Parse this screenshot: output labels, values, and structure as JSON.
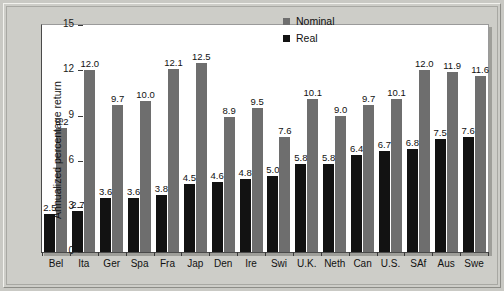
{
  "chart_data": {
    "type": "bar",
    "title": "",
    "subtitle": "",
    "xlabel": "",
    "ylabel": "Annualized percentage return",
    "ylim": [
      0,
      15
    ],
    "yticks": [
      0,
      3,
      6,
      9,
      12,
      15
    ],
    "grid": false,
    "legend_position": "top-right",
    "categories": [
      "Bel",
      "Ita",
      "Ger",
      "Spa",
      "Fra",
      "Jap",
      "Den",
      "Ire",
      "Swi",
      "U.K.",
      "Neth",
      "Can",
      "U.S.",
      "SAf",
      "Aus",
      "Swe"
    ],
    "series": [
      {
        "name": "Real",
        "color": "#121212",
        "values": [
          2.5,
          2.7,
          3.6,
          3.6,
          3.8,
          4.5,
          4.6,
          4.8,
          5.0,
          5.8,
          5.8,
          6.4,
          6.7,
          6.8,
          7.5,
          7.6
        ],
        "labels": [
          "2.5",
          "2.7",
          "3.6",
          "3.6",
          "3.8",
          "4.5",
          "4.6",
          "4.8",
          "5.0",
          "5.8",
          "5.8",
          "6.4",
          "6.7",
          "6.8",
          "7.5",
          "7.6"
        ]
      },
      {
        "name": "Nominal",
        "color": "#6e6e6e",
        "values": [
          8.2,
          12.0,
          9.7,
          10.0,
          12.1,
          12.5,
          8.9,
          9.5,
          7.6,
          10.1,
          9.0,
          9.7,
          10.1,
          12.0,
          11.9,
          11.6
        ],
        "labels": [
          "8.2",
          "12.0",
          "9.7",
          "10.0",
          "12.1",
          "12.5",
          "8.9",
          "9.5",
          "7.6",
          "10.1",
          "9.0",
          "9.7",
          "10.1",
          "12.0",
          "11.9",
          "11.6"
        ]
      }
    ]
  },
  "legend": {
    "items": [
      {
        "label": "Nominal",
        "swatch": "nominal"
      },
      {
        "label": "Real",
        "swatch": "real"
      }
    ]
  }
}
